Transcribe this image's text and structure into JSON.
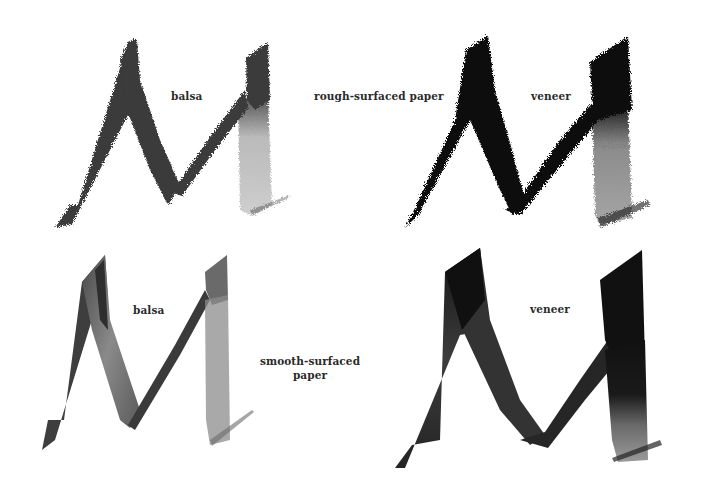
{
  "figure": {
    "rows": [
      {
        "paper_label": "rough-surfaced paper",
        "samples": [
          {
            "tool_label": "balsa",
            "letter": "M",
            "ink_color": "#3a3a3a",
            "texture": "dry-brush rough"
          },
          {
            "tool_label": "veneer",
            "letter": "M",
            "ink_color": "#0d0d0d",
            "texture": "dry-brush rough"
          }
        ]
      },
      {
        "paper_label_lines": [
          "smooth-surfaced",
          "paper"
        ],
        "samples": [
          {
            "tool_label": "balsa",
            "letter": "M",
            "ink_color": "#5a5a5a",
            "texture": "smooth wash"
          },
          {
            "tool_label": "veneer",
            "letter": "M",
            "ink_color": "#1e1e1e",
            "texture": "smooth wash"
          }
        ]
      }
    ]
  },
  "labels": {
    "top_left": "balsa",
    "top_middle": "rough-surfaced paper",
    "top_right": "veneer",
    "bottom_left": "balsa",
    "bottom_middle_line1": "smooth-surfaced",
    "bottom_middle_line2": "paper",
    "bottom_right": "veneer"
  },
  "colors": {
    "background": "#ffffff",
    "text": "#2a2a2a"
  }
}
